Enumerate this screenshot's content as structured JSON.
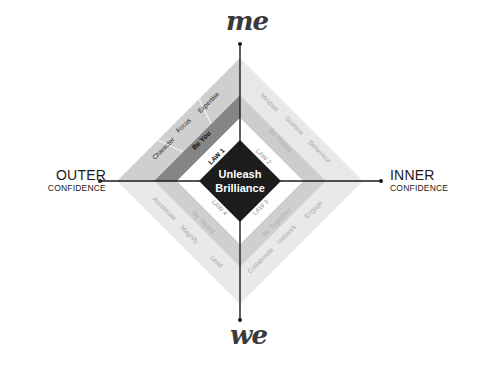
{
  "axes": {
    "top": "me",
    "bottom": "we",
    "left": {
      "title": "OUTER",
      "subtitle": "CONFIDENCE"
    },
    "right": {
      "title": "INNER",
      "subtitle": "CONFIDENCE"
    }
  },
  "center": {
    "line1": "Unleash",
    "line2": "Brilliance"
  },
  "quadrants": {
    "top_left": {
      "law": "LAW 1",
      "theme": "Be You",
      "traits": [
        "Character",
        "Focus",
        "Expertise"
      ]
    },
    "top_right": {
      "law": "LAW 2",
      "theme": "Be Happy",
      "traits": [
        "Mindset",
        "Stamina",
        "Behaviour"
      ]
    },
    "bottom_right": {
      "law": "LAW 3",
      "theme": "Be Together",
      "traits": [
        "Collaborate",
        "Network",
        "Engage"
      ]
    },
    "bottom_left": {
      "law": "LAW 4",
      "theme": "Be Heard",
      "traits": [
        "Accelerate",
        "Magnify",
        "Lead"
      ]
    }
  },
  "colors": {
    "center": "#1c1c1c",
    "axis": "#1a1a1a",
    "tl_outer": "#cfcfcf",
    "tl_theme": "#858585",
    "tl_law": "#ffffff",
    "tr_outer": "#e8e8e8",
    "tr_theme": "#cdcdcd",
    "br_outer": "#e9e9e9",
    "br_theme": "#cfcfcf",
    "bl_outer": "#e9e9e9",
    "bl_theme": "#cfcfcf"
  }
}
